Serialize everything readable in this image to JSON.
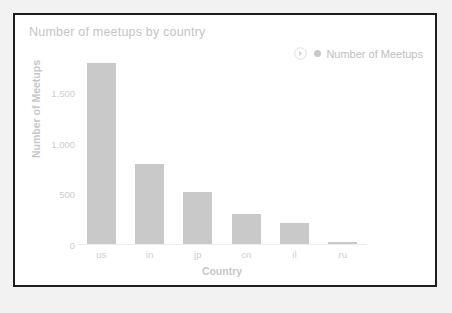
{
  "card": {
    "border_color": "#1d1d1d",
    "background_color": "#ffffff"
  },
  "chart_data": {
    "type": "bar",
    "title": "Number of meetups by country",
    "xlabel": "Country",
    "ylabel": "Number of Meetups",
    "categories": [
      "us",
      "in",
      "jp",
      "cn",
      "il",
      "ru"
    ],
    "values": [
      1800,
      800,
      520,
      310,
      215,
      25
    ],
    "series": [
      {
        "name": "Number of Meetups",
        "values": [
          1800,
          800,
          520,
          310,
          215,
          25
        ]
      }
    ],
    "ylim": [
      0,
      1900
    ],
    "ytick_labels": [
      "0",
      "500",
      "1,000",
      "1,500"
    ],
    "ytick_values": [
      0,
      500,
      1000,
      1500
    ],
    "grid": false,
    "legend_position": "top-right",
    "bar_color": "#c9c9c9",
    "text_color": "#c7c7c7"
  },
  "legend": {
    "toggle_icon": "chevron-right-circle-icon",
    "marker_icon": "series-dot-icon",
    "label": "Number of Meetups"
  }
}
